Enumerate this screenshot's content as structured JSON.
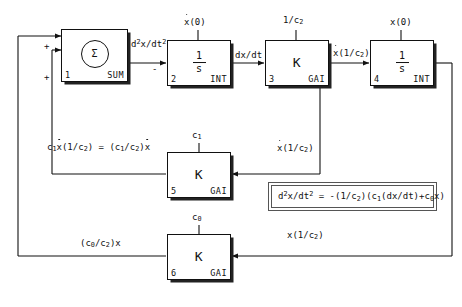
{
  "diagram": {
    "blocks": [
      {
        "id": "sum",
        "index": "1",
        "kind": "SUM",
        "symbol": "Σ",
        "top_label": "",
        "type": "summer"
      },
      {
        "id": "int1",
        "index": "2",
        "kind": "INT",
        "numerator": "1",
        "denominator": "s",
        "top_label": "x(0)",
        "top_label_dot": true,
        "type": "integrator"
      },
      {
        "id": "gain3",
        "index": "3",
        "kind": "GAI",
        "symbol": "K",
        "top_label": "1/c2",
        "top_label_base": "1/c",
        "top_label_sub": "2",
        "type": "gain"
      },
      {
        "id": "int2",
        "index": "4",
        "kind": "INT",
        "numerator": "1",
        "denominator": "s",
        "top_label": "x(0)",
        "top_label_dot": false,
        "type": "integrator"
      },
      {
        "id": "gain5",
        "index": "5",
        "kind": "GAI",
        "symbol": "K",
        "top_label": "c1",
        "top_label_base": "c",
        "top_label_sub": "1",
        "type": "gain"
      },
      {
        "id": "gain6",
        "index": "6",
        "kind": "GAI",
        "symbol": "K",
        "top_label": "c0",
        "top_label_base": "c",
        "top_label_sub": "0",
        "type": "gain"
      }
    ],
    "signal_labels": {
      "sum_output": "d2x/dt2",
      "sum_output_parts": {
        "d": "d",
        "sup": "2",
        "mid": "x/dt",
        "sup2": "2"
      },
      "int1_output": "dx/dt",
      "gain3_output_base": "x(1/c",
      "gain3_output_sub": "2",
      "gain3_output_dot": true,
      "gain5_input_base": "x(1/c",
      "gain5_input_sub": "2",
      "gain5_input_dot": true,
      "gain6_input_base": "x(1/c",
      "gain6_input_sub": "2",
      "gain6_input_dot": false,
      "gain5_output": "c1x(1/c2) = (c1/c2)x",
      "gain6_output": "(c0/c2)x"
    },
    "sign_marks": {
      "sum_in_top": "+",
      "sum_in_bottom": "+",
      "int1_in": "-"
    },
    "equation": {
      "lhs_d": "d",
      "lhs_sup": "2",
      "lhs_mid": "x/dt",
      "lhs_sup2": "2",
      "rhs": " = -(1/c2)(c1(dx/dt)+c0x)",
      "full_text": "d2x/dt2 = -(1/c2)(c1(dx/dt)+c0x)"
    },
    "colors": {
      "line": "#111111",
      "background": "#ffffff",
      "box_border": "#555555"
    }
  }
}
